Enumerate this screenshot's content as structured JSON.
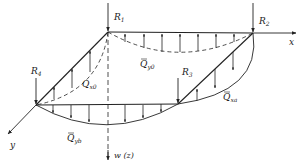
{
  "diagram": {
    "type": "plate-reaction-and-edge-shear-distribution",
    "axes": {
      "x_label": "x",
      "y_label": "y",
      "z_label": "w (z)"
    },
    "corner_reactions": [
      {
        "id": "R1",
        "base": "R",
        "sub": "1"
      },
      {
        "id": "R2",
        "base": "R",
        "sub": "2"
      },
      {
        "id": "R3",
        "base": "R",
        "sub": "3"
      },
      {
        "id": "R4",
        "base": "R",
        "sub": "4"
      }
    ],
    "edge_shears": [
      {
        "id": "Qy0",
        "base": "Q",
        "bar": true,
        "sub": "y0",
        "edge": "top (y=0)"
      },
      {
        "id": "Qx0",
        "base": "Q",
        "bar": false,
        "sub": "x0",
        "edge": "left (x=0)"
      },
      {
        "id": "Qxa",
        "base": "Q",
        "bar": true,
        "sub": "xa",
        "edge": "right (x=a)"
      },
      {
        "id": "Qyb",
        "base": "Q",
        "bar": true,
        "sub": "yb",
        "edge": "bottom (y=b)"
      }
    ]
  }
}
